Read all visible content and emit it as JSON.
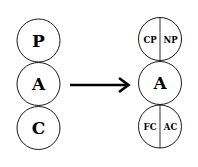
{
  "diagram": {
    "left_column": {
      "circles": [
        {
          "label": "P"
        },
        {
          "label": "A"
        },
        {
          "label": "C"
        }
      ]
    },
    "arrow": {
      "direction": "right"
    },
    "right_column": {
      "circles": [
        {
          "left_label": "CP",
          "right_label": "NP",
          "split": true
        },
        {
          "label": "A",
          "split": false
        },
        {
          "left_label": "FC",
          "right_label": "AC",
          "split": true
        }
      ]
    },
    "colors": {
      "stroke": "#000000",
      "background": "#ffffff",
      "text": "#000000"
    }
  }
}
